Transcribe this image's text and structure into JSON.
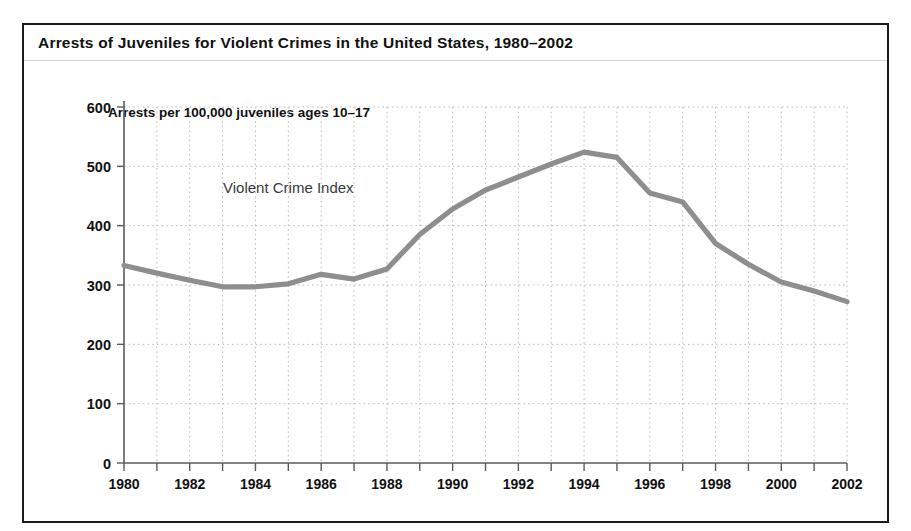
{
  "figure": {
    "title": "Arrests of Juveniles for Violent Crimes in the United States, 1980–2002",
    "axis_title": "Arrests per 100,000 juveniles ages 10–17",
    "border_color": "#1b1b1b",
    "background": "#ffffff"
  },
  "chart_data": {
    "type": "line",
    "title": "Arrests of Juveniles for Violent Crimes in the United States, 1980–2002",
    "subtitle": "",
    "xlabel": "",
    "ylabel": "Arrests per 100,000 juveniles ages 10–17",
    "xlim": [
      1980,
      2002
    ],
    "ylim": [
      0,
      600
    ],
    "yticks": [
      0,
      100,
      200,
      300,
      400,
      500,
      600
    ],
    "ytick_labels": [
      "0",
      "100",
      "200",
      "300",
      "400",
      "500",
      "600"
    ],
    "xticks": [
      1980,
      1981,
      1982,
      1983,
      1984,
      1985,
      1986,
      1987,
      1988,
      1989,
      1990,
      1991,
      1992,
      1993,
      1994,
      1995,
      1996,
      1997,
      1998,
      1999,
      2000,
      2001,
      2002
    ],
    "xtick_labels": [
      "1980",
      "",
      "1982",
      "",
      "1984",
      "",
      "1986",
      "",
      "1988",
      "",
      "1990",
      "",
      "1992",
      "",
      "1994",
      "",
      "1996",
      "",
      "1998",
      "",
      "2000",
      "",
      "2002"
    ],
    "xtick_labels_shown": [
      "1980",
      "1982",
      "1984",
      "1986",
      "1988",
      "1990",
      "1992",
      "1994",
      "1996",
      "1998",
      "2000",
      "2002"
    ],
    "grid": true,
    "grid_style": "dotted",
    "grid_color": "#b9b9b9",
    "legend": "none",
    "annotations": [
      {
        "text": "Violent Crime Index",
        "x": 1985.0,
        "y": 455,
        "color": "#3a3a3a"
      }
    ],
    "series": [
      {
        "name": "Violent Crime Index",
        "color": "#8e8e8e",
        "line_width": 5,
        "x": [
          1980,
          1981,
          1982,
          1983,
          1984,
          1985,
          1986,
          1987,
          1988,
          1989,
          1990,
          1991,
          1992,
          1993,
          1994,
          1995,
          1996,
          1997,
          1998,
          1999,
          2000,
          2001,
          2002
        ],
        "values": [
          333,
          320,
          308,
          297,
          297,
          302,
          318,
          310,
          327,
          385,
          428,
          460,
          482,
          504,
          524,
          515,
          455,
          440,
          370,
          335,
          305,
          290,
          272
        ]
      }
    ]
  }
}
